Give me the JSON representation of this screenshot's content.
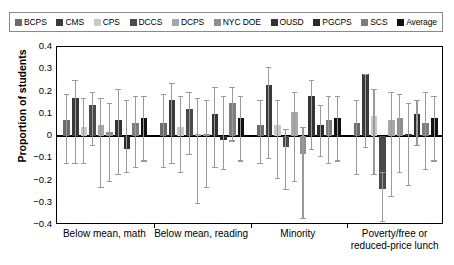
{
  "legend": {
    "items": [
      {
        "label": "BCPS",
        "color": "#6b6b6b"
      },
      {
        "label": "CMS",
        "color": "#3a3a3a"
      },
      {
        "label": "CPS",
        "color": "#c9c9c9"
      },
      {
        "label": "DCCS",
        "color": "#4a4a4a"
      },
      {
        "label": "DCPS",
        "color": "#a8a8a8"
      },
      {
        "label": "NYC DOE",
        "color": "#8f8f8f"
      },
      {
        "label": "OUSD",
        "color": "#333333"
      },
      {
        "label": "PGCPS",
        "color": "#2b2b2b"
      },
      {
        "label": "SCS",
        "color": "#7d7d7d"
      },
      {
        "label": "Average",
        "color": "#111111"
      }
    ]
  },
  "chart_data": {
    "type": "bar",
    "title": "",
    "xlabel": "",
    "ylabel": "Proportion of students",
    "ylim": [
      -0.4,
      0.4
    ],
    "yticks": [
      "0.4",
      "0.3",
      "0.2",
      "0.1",
      "0",
      "−0.1",
      "−0.2",
      "−0.3",
      "−0.4"
    ],
    "grid": false,
    "legend_position": "top",
    "error_bars": true,
    "categories": [
      "Below mean, math",
      "Below mean, reading",
      "Minority",
      "Poverty/free or reduced-price lunch"
    ],
    "series": [
      {
        "name": "BCPS",
        "values": [
          0.07,
          0.06,
          0.05,
          0.06
        ],
        "err_low": [
          0.19,
          0.2,
          0.17,
          0.23
        ],
        "err_high": [
          0.12,
          0.13,
          0.11,
          0.1
        ]
      },
      {
        "name": "CMS",
        "values": [
          0.17,
          0.16,
          0.23,
          0.28
        ],
        "err_low": [
          0.29,
          0.28,
          0.33,
          0.33
        ],
        "err_high": [
          0.08,
          0.08,
          0.08,
          0.0
        ]
      },
      {
        "name": "CPS",
        "values": [
          0.04,
          0.04,
          0.05,
          0.09
        ],
        "err_low": [
          0.16,
          0.2,
          0.24,
          0.26
        ],
        "err_high": [
          0.13,
          0.14,
          0.11,
          0.12
        ]
      },
      {
        "name": "DCCS",
        "values": [
          0.14,
          0.12,
          -0.05,
          -0.24
        ],
        "err_low": [
          0.18,
          0.2,
          0.19,
          0.14
        ],
        "err_high": [
          0.06,
          0.08,
          0.08,
          0.08
        ]
      },
      {
        "name": "DCPS",
        "values": [
          0.05,
          0.01,
          0.11,
          0.07
        ],
        "err_low": [
          0.28,
          0.31,
          0.31,
          0.34
        ],
        "err_high": [
          0.12,
          0.16,
          0.09,
          0.13
        ]
      },
      {
        "name": "NYC DOE",
        "values": [
          0.02,
          0.01,
          -0.08,
          0.08
        ],
        "err_low": [
          0.22,
          0.24,
          0.29,
          0.24
        ],
        "err_high": [
          0.13,
          0.15,
          0.12,
          0.11
        ]
      },
      {
        "name": "OUSD",
        "values": [
          0.07,
          0.1,
          0.18,
          0.01
        ],
        "err_low": [
          0.24,
          0.24,
          0.24,
          0.23
        ],
        "err_high": [
          0.14,
          0.12,
          0.07,
          0.14
        ]
      },
      {
        "name": "PGCPS",
        "values": [
          -0.06,
          -0.02,
          0.05,
          0.1
        ],
        "err_low": [
          0.1,
          0.13,
          0.14,
          0.14
        ],
        "err_high": [
          0.22,
          0.2,
          0.09,
          0.06
        ]
      },
      {
        "name": "SCS",
        "values": [
          0.06,
          0.15,
          0.07,
          0.06
        ],
        "err_low": [
          0.2,
          0.17,
          0.19,
          0.21
        ],
        "err_high": [
          0.12,
          0.07,
          0.11,
          0.14
        ]
      },
      {
        "name": "Average",
        "values": [
          0.08,
          0.08,
          0.08,
          0.08
        ],
        "err_low": [
          0.19,
          0.19,
          0.19,
          0.19
        ],
        "err_high": [
          0.1,
          0.1,
          0.1,
          0.1
        ]
      }
    ]
  }
}
